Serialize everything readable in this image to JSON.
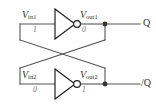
{
  "figure": {
    "kind": "circuit-schematic",
    "colors": {
      "wire": "#555555",
      "outline": "#222222",
      "label": "#333333",
      "logic_value": "#6e6e6e",
      "background": "#ffffff"
    }
  },
  "stages": [
    {
      "id": "top",
      "input": {
        "name": "V",
        "subscript": "in1",
        "logic_value": "1"
      },
      "gate": {
        "type": "inverter",
        "symbol": "triangle-with-bubble"
      },
      "output": {
        "name": "V",
        "subscript": "out1",
        "logic_value": "0"
      },
      "port": {
        "label": "Q"
      }
    },
    {
      "id": "bottom",
      "input": {
        "name": "V",
        "subscript": "in2",
        "logic_value": "0"
      },
      "gate": {
        "type": "inverter",
        "symbol": "triangle-with-bubble"
      },
      "output": {
        "name": "V",
        "subscript": "out2",
        "logic_value": "1"
      },
      "port": {
        "label": "/Q"
      }
    }
  ]
}
